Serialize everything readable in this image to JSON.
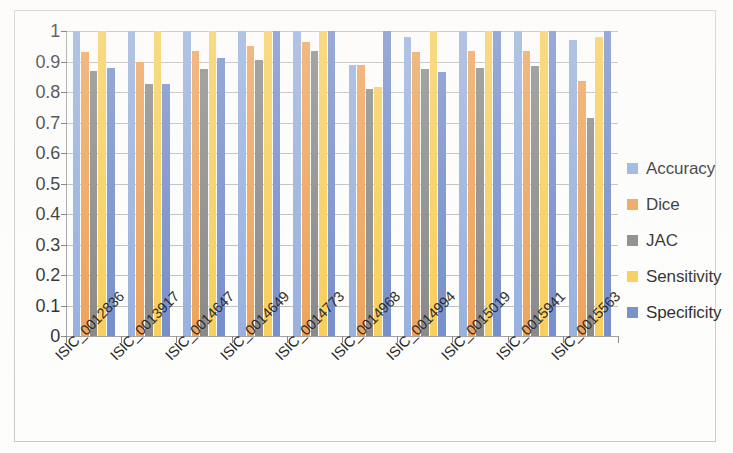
{
  "chart_data": {
    "type": "bar",
    "title": "",
    "subtitle": "",
    "xlabel": "",
    "ylabel": "",
    "ylim": [
      0,
      1
    ],
    "ytick_step": 0.1,
    "grid": true,
    "legend_position": "right",
    "categories": [
      "ISIC_0012836",
      "ISIC_0013917",
      "ISIC_0014647",
      "ISIC_0014649",
      "ISIC_0014773",
      "ISIC_0014968",
      "ISIC_0014994",
      "ISIC_0015019",
      "ISIC_0015941",
      "ISIC_0015563"
    ],
    "ytick_labels": [
      "0",
      "0.1",
      "0.2",
      "0.3",
      "0.4",
      "0.5",
      "0.6",
      "0.7",
      "0.8",
      "0.9",
      "1"
    ],
    "series": [
      {
        "name": "Accuracy",
        "color": "#8faadc",
        "values": [
          1.0,
          1.0,
          1.0,
          1.0,
          1.0,
          0.89,
          0.98,
          1.0,
          1.0,
          0.97
        ]
      },
      {
        "name": "Dice",
        "color": "#ed9b4c",
        "values": [
          0.93,
          0.9,
          0.935,
          0.95,
          0.965,
          0.89,
          0.93,
          0.935,
          0.935,
          0.835
        ]
      },
      {
        "name": "JAC",
        "color": "#7f7f7f",
        "values": [
          0.87,
          0.825,
          0.875,
          0.905,
          0.935,
          0.81,
          0.875,
          0.88,
          0.885,
          0.715
        ]
      },
      {
        "name": "Sensitivity",
        "color": "#f8cb4c",
        "values": [
          1.0,
          1.0,
          1.0,
          1.0,
          1.0,
          0.815,
          1.0,
          1.0,
          1.0,
          0.98
        ]
      },
      {
        "name": "Specificity",
        "color": "#6a84c8",
        "values": [
          0.88,
          0.825,
          0.91,
          1.0,
          1.0,
          1.0,
          0.865,
          1.0,
          1.0,
          1.0
        ]
      }
    ]
  },
  "legend": {
    "items": [
      {
        "label": "Accuracy",
        "color": "#8faadc"
      },
      {
        "label": "Dice",
        "color": "#ed9b4c"
      },
      {
        "label": "JAC",
        "color": "#7f7f7f"
      },
      {
        "label": "Sensitivity",
        "color": "#f8cb4c"
      },
      {
        "label": "Specificity",
        "color": "#6a84c8"
      }
    ]
  }
}
